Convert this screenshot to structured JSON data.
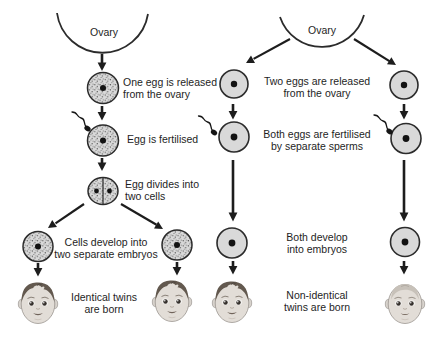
{
  "diagram": {
    "identical_path": {
      "ovary_label": "Ovary",
      "steps": [
        "One egg is released\nfrom the ovary",
        "Egg is fertilised",
        "Egg divides into\ntwo cells",
        "Cells develop into\ntwo separate embryos",
        "Identical twins\nare born"
      ]
    },
    "fraternal_path": {
      "ovary_label": "Ovary",
      "steps": [
        "Two eggs are released\nfrom the ovary",
        "Both eggs are fertilised\nby separate sperms",
        "Both develop\ninto embryos",
        "Non-identical\ntwins are born"
      ]
    },
    "icons": {
      "ovary": "downward-open-arc",
      "egg_cell": "circle-with-nucleus",
      "stippled_egg_cell": "dotted-circle-with-nucleus",
      "two_cell_stage": "divided-circle-two-nuclei",
      "sperm": "tadpole-squiggle",
      "baby": "infant-face",
      "arrow": "solid-black-arrow"
    },
    "colors": {
      "background": "#ffffff",
      "line": "#1d1d1d",
      "egg_fill": "#d9d9d9",
      "egg_outline": "#2b2b2b",
      "stipple_dot": "#4f4f4f",
      "text": "#1e1e1e",
      "hair_dark": "#63594f",
      "hair_light": "#c7c1b9"
    }
  }
}
